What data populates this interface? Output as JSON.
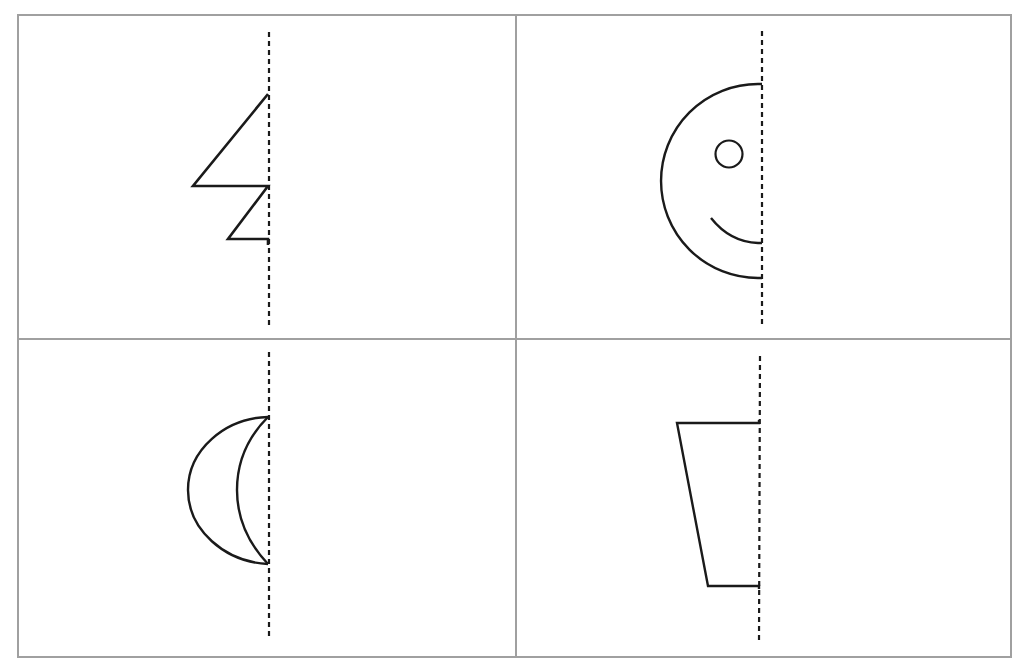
{
  "title": "",
  "worksheet": {
    "task": "Complete the symmetric figure across the dashed line of symmetry",
    "grid": {
      "rows": 2,
      "cols": 2,
      "border_color": "#a0a0a0"
    },
    "stroke_color": "#1a1a1a",
    "axis_style": "dashed",
    "panels": [
      {
        "id": "top-left",
        "shape": "zigzag-triangles",
        "description": "Half of a zigzag / lightning-bolt shape made of two triangles"
      },
      {
        "id": "top-right",
        "shape": "smiley-face",
        "description": "Half of a smiley face with one eye and half a smile"
      },
      {
        "id": "bottom-left",
        "shape": "crescent-moon",
        "description": "Half of a crescent moon shape"
      },
      {
        "id": "bottom-right",
        "shape": "trapezoid",
        "description": "Half of a trapezoid (cup) shape"
      }
    ]
  }
}
